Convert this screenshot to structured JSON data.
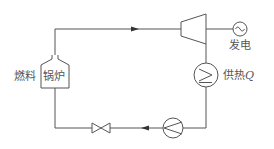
{
  "diagram": {
    "type": "cogeneration-cycle",
    "labels": {
      "fuel": "燃料",
      "boiler": "锅炉",
      "power": "发电",
      "heat_supply": "供热",
      "heat_symbol": "Q"
    },
    "components": [
      {
        "id": "boiler",
        "name": "锅炉"
      },
      {
        "id": "turbine",
        "name": "turbine"
      },
      {
        "id": "generator",
        "name": "发电"
      },
      {
        "id": "heat-exchanger",
        "name": "供热Q"
      },
      {
        "id": "pump",
        "name": "pump"
      },
      {
        "id": "valve",
        "name": "valve"
      }
    ],
    "flow_direction": "clockwise",
    "colors": {
      "line": "#555555",
      "background": "#ffffff"
    }
  }
}
